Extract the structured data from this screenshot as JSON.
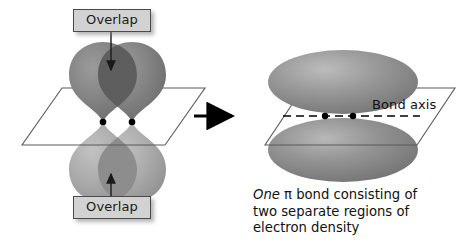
{
  "figure": {
    "background_color": "#ffffff"
  },
  "left_diagram": {
    "name": "two-p-orbitals-overlapping",
    "overlap_top_label": "Overlap",
    "overlap_bottom_label": "Overlap",
    "nuclei_count": 2,
    "lobe_count": 4,
    "plane_shape": "parallelogram",
    "colors": {
      "lobe_dark": "#7c7c7c",
      "lobe_light": "#a8a8a8",
      "overlap_region": "#636363",
      "nucleus": "#000000",
      "plane_stroke": "#5a5a5a",
      "label_fill": "#d2d2d2",
      "label_border": "#4a4a4a"
    }
  },
  "transition_arrow": {
    "name": "transition-arrow",
    "direction": "right",
    "color": "#000000"
  },
  "right_diagram": {
    "name": "pi-bond-electron-density",
    "bond_axis_label": "Bond axis",
    "nuclei_count": 2,
    "lobe_count": 2,
    "plane_shape": "parallelogram",
    "axis_style": "dashed",
    "colors": {
      "cloud": "#8a8a8a",
      "cloud_highlight": "#b5b5b5",
      "nucleus": "#000000",
      "plane_stroke": "#5a5a5a",
      "axis": "#000000"
    }
  },
  "caption": {
    "emphasis_word": "One",
    "line1_rest": " π bond consisting of",
    "line2": "two separate regions of",
    "line3": "electron density",
    "full_text": "One π bond consisting of two separate regions of electron density"
  }
}
